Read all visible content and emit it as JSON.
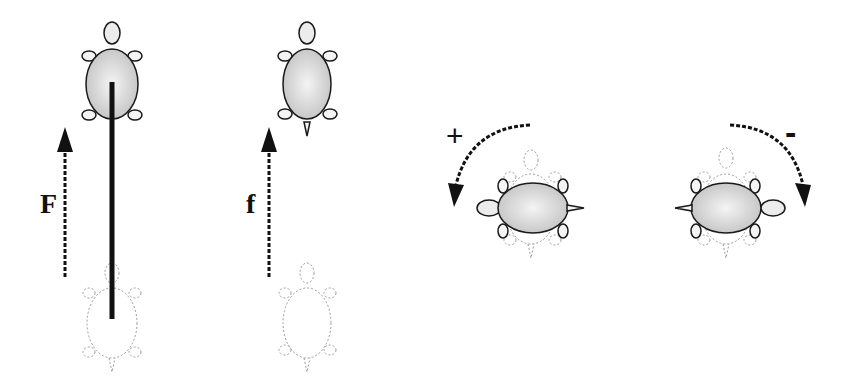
{
  "diagram": {
    "panels": [
      {
        "id": "translation-with-stick",
        "force_label": "F",
        "description": "Turtle moved forward by force F, with rigid stick"
      },
      {
        "id": "translation-free",
        "force_label": "f",
        "description": "Turtle moved forward by force f"
      },
      {
        "id": "rotation-positive",
        "sign_label": "+",
        "description": "Counter-clockwise rotation"
      },
      {
        "id": "rotation-negative",
        "sign_label": "-",
        "description": "Clockwise rotation"
      }
    ],
    "colors": {
      "outline": "#1a1a1a",
      "body_fill": "#d9d9d9",
      "ghost": "#9a9a9a",
      "stick": "#111111"
    }
  }
}
